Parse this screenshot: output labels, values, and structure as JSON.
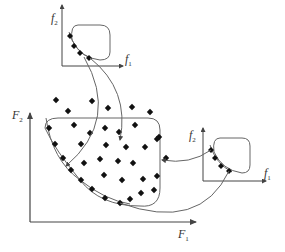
{
  "diagram": {
    "main_axes": {
      "x_label": "F",
      "x_sub": "1",
      "y_label": "F",
      "y_sub": "2"
    },
    "top_inset": {
      "x_label": "f",
      "x_sub": "1",
      "y_label": "f",
      "y_sub": "2"
    },
    "right_inset": {
      "x_label": "f",
      "x_sub": "1",
      "y_label": "f",
      "y_sub": "2"
    },
    "colors": {
      "line": "#555555",
      "point": "#111111",
      "axis": "#444444"
    },
    "main_points": [
      [
        56,
        100
      ],
      [
        92,
        101
      ],
      [
        68,
        111
      ],
      [
        108,
        108
      ],
      [
        132,
        107
      ],
      [
        150,
        112
      ],
      [
        49,
        128
      ],
      [
        74,
        125
      ],
      [
        90,
        133
      ],
      [
        105,
        128
      ],
      [
        119,
        132
      ],
      [
        135,
        125
      ],
      [
        159,
        137
      ],
      [
        55,
        144
      ],
      [
        81,
        144
      ],
      [
        106,
        145
      ],
      [
        126,
        147
      ],
      [
        145,
        147
      ],
      [
        157,
        139
      ],
      [
        63,
        158
      ],
      [
        84,
        163
      ],
      [
        100,
        159
      ],
      [
        118,
        161
      ],
      [
        133,
        163
      ],
      [
        166,
        158
      ],
      [
        71,
        170
      ],
      [
        104,
        175
      ],
      [
        122,
        180
      ],
      [
        143,
        179
      ],
      [
        157,
        176
      ],
      [
        81,
        180
      ],
      [
        92,
        189
      ],
      [
        105,
        198
      ],
      [
        120,
        203
      ],
      [
        130,
        199
      ],
      [
        141,
        193
      ],
      [
        154,
        190
      ]
    ],
    "pareto_points": [
      [
        49,
        128
      ],
      [
        55,
        144
      ],
      [
        63,
        158
      ],
      [
        71,
        170
      ],
      [
        81,
        180
      ],
      [
        92,
        189
      ],
      [
        105,
        198
      ],
      [
        120,
        203
      ]
    ],
    "top_inset_points": [
      [
        70,
        36
      ],
      [
        74,
        46
      ],
      [
        80,
        53
      ],
      [
        89,
        58
      ]
    ],
    "right_inset_points": [
      [
        211,
        150
      ],
      [
        215,
        158
      ],
      [
        221,
        166
      ],
      [
        229,
        171
      ]
    ]
  }
}
